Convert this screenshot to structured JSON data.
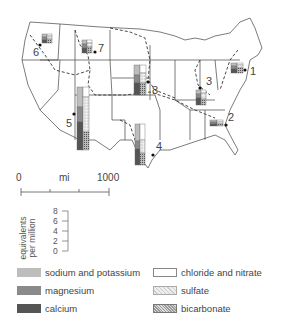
{
  "map": {
    "title": "Dissolved solids in major US rivers",
    "sites": [
      {
        "id": "1",
        "label": "1",
        "x": 250,
        "y": 66
      },
      {
        "id": "2",
        "label": "2",
        "x": 228,
        "y": 112
      },
      {
        "id": "3",
        "label": "3",
        "x": 206,
        "y": 76
      },
      {
        "id": "4",
        "label": "4",
        "x": 156,
        "y": 141
      },
      {
        "id": "5",
        "label": "5",
        "x": 66,
        "y": 118
      },
      {
        "id": "6",
        "label": "6",
        "x": 33,
        "y": 47
      },
      {
        "id": "7",
        "label": "7",
        "x": 98,
        "y": 43
      },
      {
        "id": "8",
        "label": "8",
        "x": 152,
        "y": 85
      }
    ]
  },
  "scale": {
    "start": "0",
    "unit": "mi",
    "end": "1000"
  },
  "concentration_axis": {
    "label_line1": "equivalents",
    "label_line2": "per million",
    "ticks": [
      "8",
      "6",
      "4",
      "2",
      "0"
    ]
  },
  "legend": {
    "items": [
      {
        "key": "sodium_potassium",
        "label": "sodium and potassium",
        "color": "#bdbdbd"
      },
      {
        "key": "magnesium",
        "label": "magnesium",
        "color": "#8a8a8a"
      },
      {
        "key": "calcium",
        "label": "calcium",
        "color": "#555555"
      },
      {
        "key": "chloride_nitrate",
        "label": "chloride and nitrate",
        "color": "#ffffff"
      },
      {
        "key": "sulfate",
        "label": "sulfate",
        "pattern": "light stipple"
      },
      {
        "key": "bicarbonate",
        "label": "bicarbonate",
        "pattern": "dense stipple"
      }
    ]
  }
}
